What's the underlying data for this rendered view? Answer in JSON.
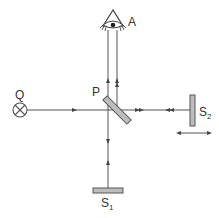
{
  "diagram": {
    "labels": {
      "observer": "A",
      "source": "Q",
      "beam_splitter": "P",
      "mirror_fixed": "S",
      "mirror_fixed_sub": "1",
      "mirror_movable": "S",
      "mirror_movable_sub": "2"
    },
    "components": [
      {
        "id": "A",
        "type": "eye-observer"
      },
      {
        "id": "Q",
        "type": "light-source"
      },
      {
        "id": "P",
        "type": "beam-splitter"
      },
      {
        "id": "S1",
        "type": "mirror-fixed"
      },
      {
        "id": "S2",
        "type": "mirror-movable"
      }
    ],
    "colors": {
      "line": "#555555",
      "mirror_fill": "#bdbdbd",
      "text": "#333333"
    }
  }
}
